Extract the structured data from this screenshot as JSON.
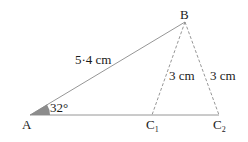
{
  "diagram": {
    "points": {
      "A": {
        "label": "A",
        "x": 30,
        "y": 115
      },
      "B": {
        "label": "B",
        "x": 185,
        "y": 22
      },
      "C1": {
        "label": "C",
        "sub": "1",
        "x": 152,
        "y": 115
      },
      "C2": {
        "label": "C",
        "sub": "2",
        "x": 219,
        "y": 115
      }
    },
    "labels": {
      "AB": "5·4 cm",
      "BC1": "3 cm",
      "BC2": "3 cm",
      "angleA": "32°"
    },
    "colors": {
      "line": "#8a8a8a",
      "angle_fill": "#8c8c8c",
      "text": "#1a1a1a"
    }
  }
}
